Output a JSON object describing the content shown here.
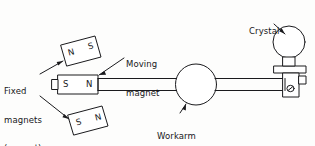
{
  "diagram": {
    "background_color": "#fdfdfc",
    "ink_color": "#1a1a1d",
    "labels": {
      "crystal": "Crystal",
      "moving_magnet_line1": "Moving",
      "moving_magnet_line2": "magnet",
      "fixed_magnets_line1": "Fixed",
      "fixed_magnets_line2": "magnets",
      "fixed_magnets_line3": "(pre-set)",
      "workarm_bearing_line1": "Workarm",
      "workarm_bearing_line2": "bearing"
    },
    "magnets": {
      "upper_fixed": {
        "left_pole": "N",
        "right_pole": "S"
      },
      "moving": {
        "left_pole": "S",
        "right_pole": "N"
      },
      "lower_fixed": {
        "left_pole": "S",
        "right_pole": "N"
      }
    }
  }
}
